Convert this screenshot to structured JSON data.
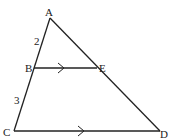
{
  "diagram": {
    "type": "geometry-triangle",
    "points": {
      "A": {
        "label": "A",
        "x": 50,
        "y": 18
      },
      "B": {
        "label": "B",
        "x": 34,
        "y": 68
      },
      "E": {
        "label": "E",
        "x": 97,
        "y": 68
      },
      "C": {
        "label": "C",
        "x": 14,
        "y": 131
      },
      "D": {
        "label": "D",
        "x": 160,
        "y": 131
      }
    },
    "segment_labels": {
      "AB": "2",
      "BC": "3"
    },
    "parallel_marks": [
      "BE",
      "CD"
    ],
    "stroke_color": "#222222"
  }
}
